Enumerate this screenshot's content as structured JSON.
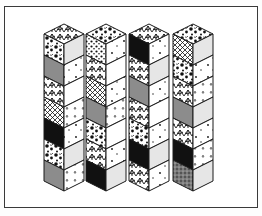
{
  "figure": {
    "frame": {
      "left": 4,
      "top": 6,
      "width": 252,
      "height": 200,
      "stroke": "#3a3a3a"
    },
    "colors": {
      "black": "#111111",
      "gray": "#8c8c8c",
      "light": "#e6e6e6",
      "white": "#ffffff",
      "line": "#1a1a1a"
    },
    "geometry": {
      "half_width": 20,
      "rise": 10,
      "segment_height": 21,
      "top_y": 24,
      "segments": 7
    },
    "columns": [
      {
        "name": "column-1",
        "peak_x": 64,
        "top": "texture-leaf",
        "left": [
          "texture-blob",
          "gray",
          "texture-leaf",
          "texture-hatch",
          "black",
          "texture-blob",
          "gray"
        ],
        "right": [
          "light",
          "white-dots",
          "white",
          "white-tri",
          "white-dots",
          "light",
          "white-tri"
        ]
      },
      {
        "name": "column-2",
        "peak_x": 106,
        "top": "texture-blob",
        "left": [
          "texture-dots",
          "texture-leaf",
          "texture-hatch",
          "gray",
          "texture-blob",
          "texture-leaf",
          "black"
        ],
        "right": [
          "white-dots",
          "white",
          "white-dots",
          "white-tri",
          "white",
          "white-dots",
          "light"
        ]
      },
      {
        "name": "column-3",
        "peak_x": 149,
        "top": "texture-leaf",
        "left": [
          "black",
          "texture-leaf",
          "gray",
          "texture-leaf",
          "texture-blob",
          "black",
          "texture-leaf"
        ],
        "right": [
          "white-dots",
          "light",
          "white-dots",
          "white",
          "white-dots",
          "light",
          "white-dots"
        ]
      },
      {
        "name": "column-4",
        "peak_x": 193,
        "top": "texture-blob",
        "left": [
          "texture-hatch",
          "texture-blob",
          "texture-leaf",
          "gray",
          "texture-leaf",
          "black",
          "texture-speckle"
        ],
        "right": [
          "light",
          "white-dots",
          "white-tri",
          "light",
          "white-dots",
          "white-tri",
          "light"
        ]
      }
    ]
  }
}
